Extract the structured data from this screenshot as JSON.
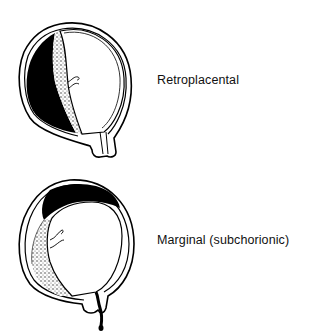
{
  "diagram": {
    "type": "medical-illustration",
    "figures": [
      {
        "id": "retroplacental",
        "label": "Retroplacental",
        "hematoma_position": "behind placenta (left wall)"
      },
      {
        "id": "marginal",
        "label": "Marginal (subchorionic)",
        "hematoma_position": "along placental margin under chorion, with vaginal bleeding"
      }
    ],
    "colors": {
      "ink": "#000000",
      "background": "#ffffff",
      "stipple": "#555555"
    }
  }
}
